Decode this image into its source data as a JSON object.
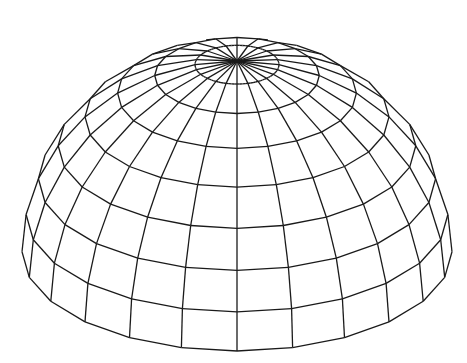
{
  "diagram": {
    "type": "wireframe-dome",
    "background": "#ffffff",
    "stroke_color": "#1a1a1a",
    "stroke_width": 1.3,
    "meridians": 24,
    "latitude_rings": 8,
    "center_x": 237,
    "apex_y": 61,
    "base_front_y": 351,
    "radius_x": 215,
    "tilt_degrees": 27.5,
    "ring_polar_angles_deg": [
      11.25,
      22.5,
      33.75,
      45,
      56.25,
      67.5,
      78.75,
      90
    ]
  }
}
